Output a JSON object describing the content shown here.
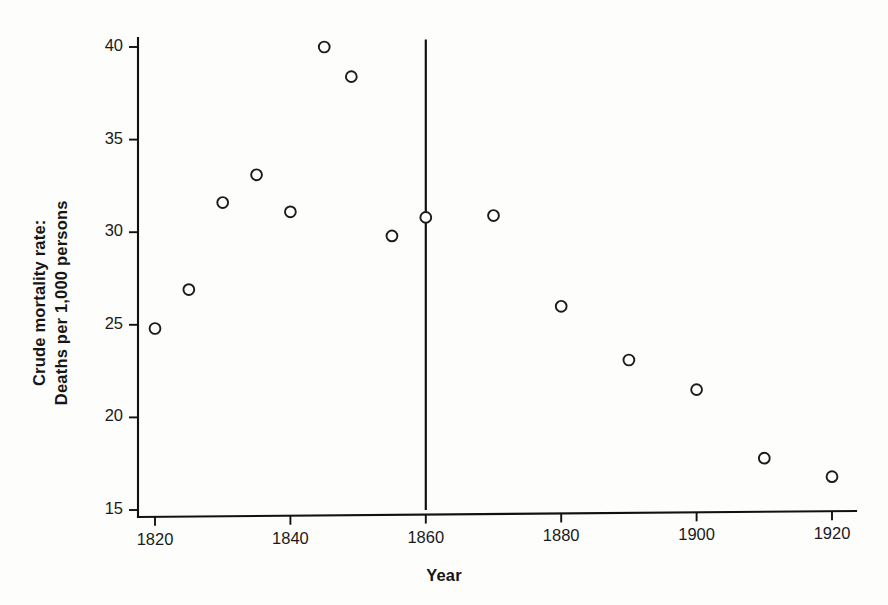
{
  "chart_data": {
    "type": "scatter",
    "title": "",
    "subtitle": "",
    "xlabel": "Year",
    "ylabel": "Crude mortality rate:\nDeaths per 1,000 persons",
    "ylabel_line1": "Crude mortality rate:",
    "ylabel_line2": "Deaths per 1,000 persons",
    "xlim": [
      1817,
      1923
    ],
    "ylim": [
      15,
      40.5
    ],
    "xticks": [
      1820,
      1840,
      1860,
      1880,
      1900,
      1920
    ],
    "xtick_labels": [
      "1820",
      "1840",
      "1860",
      "1880",
      "1900",
      "1920"
    ],
    "yticks": [
      15,
      20,
      25,
      30,
      35,
      40
    ],
    "ytick_labels": [
      "15",
      "20",
      "25",
      "30",
      "35",
      "40"
    ],
    "grid": false,
    "legend": null,
    "legend_position": "none",
    "marker_style": "open-circle",
    "marker_color": "#ffffff",
    "marker_edge_color": "#1b1b1b",
    "axis_color": "#111111",
    "background_color": "#fdfdfc",
    "x": [
      1820,
      1825,
      1830,
      1835,
      1840,
      1845,
      1849,
      1855,
      1860,
      1870,
      1880,
      1890,
      1900,
      1910,
      1920
    ],
    "values": [
      24.8,
      26.9,
      31.6,
      33.1,
      31.1,
      40.0,
      38.4,
      29.8,
      30.8,
      30.9,
      26.0,
      23.1,
      21.5,
      17.8,
      16.8
    ],
    "points": [
      {
        "x": 1820,
        "y": 24.8
      },
      {
        "x": 1825,
        "y": 26.9
      },
      {
        "x": 1830,
        "y": 31.6
      },
      {
        "x": 1835,
        "y": 33.1
      },
      {
        "x": 1840,
        "y": 31.1
      },
      {
        "x": 1845,
        "y": 40.0
      },
      {
        "x": 1849,
        "y": 38.4
      },
      {
        "x": 1855,
        "y": 29.8
      },
      {
        "x": 1860,
        "y": 30.8
      },
      {
        "x": 1870,
        "y": 30.9
      },
      {
        "x": 1880,
        "y": 26.0
      },
      {
        "x": 1890,
        "y": 23.1
      },
      {
        "x": 1900,
        "y": 21.5
      },
      {
        "x": 1910,
        "y": 17.8
      },
      {
        "x": 1920,
        "y": 16.8
      }
    ],
    "annotations": [
      {
        "type": "vertical-reference-line",
        "x": 1860,
        "y_from": 15.0,
        "y_to": 40.4,
        "label": ""
      }
    ]
  }
}
